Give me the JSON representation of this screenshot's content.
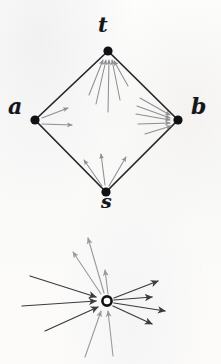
{
  "figure": {
    "background_color": "#fbfbfa",
    "edge_color": "#26262b",
    "flow_arrow_color": "#8e8e93",
    "dark_arrow_color": "#3a3a40",
    "node_fill": "#111114",
    "hollow_node_stroke": "#111114",
    "hollow_node_fill": "#ffffff"
  },
  "graph": {
    "name": "diamond-graph",
    "nodes": [
      {
        "id": "t",
        "label": "t",
        "x": 108,
        "y": 51
      },
      {
        "id": "a",
        "label": "a",
        "x": 35,
        "y": 120
      },
      {
        "id": "b",
        "label": "b",
        "x": 178,
        "y": 120
      },
      {
        "id": "s",
        "label": "s",
        "x": 106,
        "y": 192
      }
    ],
    "edges": [
      {
        "from": "a",
        "to": "t"
      },
      {
        "from": "t",
        "to": "b"
      },
      {
        "from": "a",
        "to": "s"
      },
      {
        "from": "s",
        "to": "b"
      }
    ],
    "flow_arrows": [
      {
        "at": "t",
        "direction": "into",
        "count": 5
      },
      {
        "at": "b",
        "direction": "into",
        "count": 5
      },
      {
        "at": "a",
        "direction": "out",
        "count": 2
      },
      {
        "at": "s",
        "direction": "out",
        "count": 3
      }
    ]
  },
  "field": {
    "name": "gradient-field-diagram",
    "center": {
      "x": 107,
      "y": 301,
      "radius": 5,
      "style": "hollow-circle"
    },
    "dark_arrows_inward_left": 3,
    "dark_arrows_outward_right": 4,
    "gray_arrows_outward_up": 3,
    "gray_arrows_inward_bottom": 2
  },
  "labels": {
    "t": "t",
    "a": "a",
    "b": "b",
    "s": "s"
  }
}
